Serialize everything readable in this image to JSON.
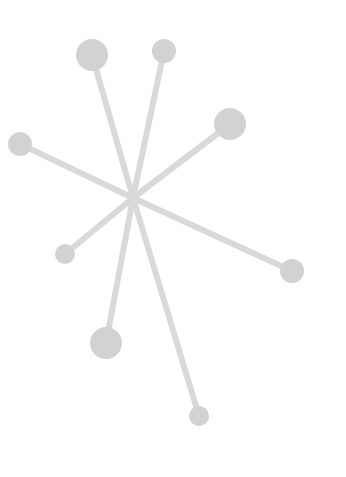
{
  "illustration": {
    "name": "molecule-star-icon",
    "canvas": {
      "width": 346,
      "height": 477,
      "background": "#ffffff"
    },
    "colors": {
      "stick": "#d9d9d9",
      "ball": "#d2d2d2"
    },
    "stick_width": 6,
    "center": {
      "x": 133,
      "y": 198
    },
    "spokes": [
      {
        "x": 92,
        "y": 55,
        "r": 16
      },
      {
        "x": 164,
        "y": 51,
        "r": 12
      },
      {
        "x": 230,
        "y": 124,
        "r": 16
      },
      {
        "x": 20,
        "y": 144,
        "r": 12
      },
      {
        "x": 65,
        "y": 254,
        "r": 10
      },
      {
        "x": 292,
        "y": 271,
        "r": 12
      },
      {
        "x": 106,
        "y": 343,
        "r": 16
      },
      {
        "x": 199,
        "y": 416,
        "r": 10
      }
    ]
  }
}
